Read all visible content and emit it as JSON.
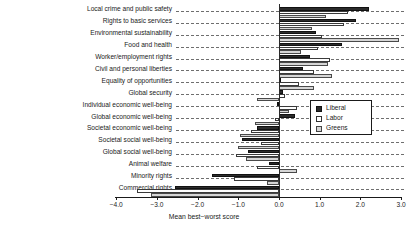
{
  "chart_data": {
    "type": "bar",
    "orientation": "horizontal",
    "title": "",
    "xlabel": "Mean best−worst score",
    "ylabel": "",
    "xlim": [
      -4.0,
      3.0
    ],
    "xticks": [
      -4.0,
      -3.0,
      -2.0,
      -1.0,
      0.0,
      1.0,
      2.0,
      3.0
    ],
    "xticklabels": [
      "-4.0",
      "-3.0",
      "-2.0",
      "-1.0",
      "0.0",
      "1.0",
      "2.0",
      "3.0"
    ],
    "grid": true,
    "grid_style": "dashed-horizontal",
    "legend_position": "center-right",
    "categories": [
      "Local crime and public safety",
      "Rights to basic services",
      "Environmental sustainability",
      "Food and health",
      "Worker/employment rights",
      "Civil and personal liberties",
      "Equality of opportunities",
      "Global security",
      "Individual economic well-being",
      "Global economic well-being",
      "Societal economic well-being",
      "Societal social well-being",
      "Global social well-being",
      "Animal welfare",
      "Minority rights",
      "Commercial rights"
    ],
    "series": [
      {
        "name": "Liberal",
        "color": "#2b2b2b",
        "values": [
          2.2,
          1.9,
          0.9,
          1.55,
          0.75,
          0.6,
          0.05,
          0.1,
          -0.05,
          0.4,
          -0.55,
          -0.9,
          -0.75,
          -0.25,
          -1.65,
          -2.55
        ]
      },
      {
        "name": "Labor",
        "color": "#ffffff",
        "values": [
          1.7,
          1.6,
          1.05,
          0.95,
          1.25,
          0.85,
          0.5,
          0.15,
          0.45,
          -0.1,
          -0.7,
          -0.45,
          -1.05,
          -0.55,
          -1.1,
          -3.5
        ]
      },
      {
        "name": "Greens",
        "color": "#d6d6d6",
        "values": [
          1.15,
          0.8,
          2.95,
          0.55,
          1.2,
          1.3,
          0.85,
          -0.55,
          0.25,
          -0.6,
          -0.95,
          -1.0,
          -0.8,
          0.45,
          -0.3,
          -3.15
        ]
      }
    ]
  },
  "legend": {
    "items": [
      {
        "label": "Liberal",
        "swatch": "liberal"
      },
      {
        "label": "Labor",
        "swatch": "labor"
      },
      {
        "label": "Greens",
        "swatch": "greens"
      }
    ]
  }
}
